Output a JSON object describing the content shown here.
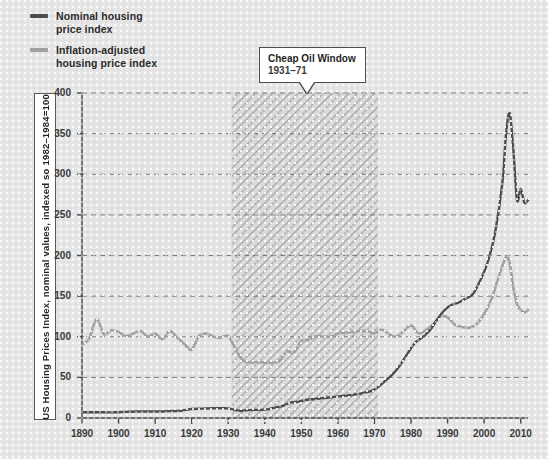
{
  "legend": {
    "items": [
      {
        "label": "Nominal housing\nprice index",
        "color": "#4d4d4d",
        "name": "nominal-housing-price-index"
      },
      {
        "label": "Inflation-adjusted\nhousing price index",
        "color": "#a0a0a0",
        "name": "inflation-adjusted-housing-price-index"
      }
    ]
  },
  "callout": {
    "title": "Cheap Oil Window",
    "subtitle": "1931–71",
    "band_start": 1931,
    "band_end": 1971
  },
  "chart_data": {
    "type": "line",
    "title": "",
    "xlabel": "",
    "ylabel": "US Housing Prices Index, nominal values, indexed so 1982–1984=100",
    "xlim": [
      1890,
      2012
    ],
    "ylim": [
      0,
      400
    ],
    "ytick_labels": [
      "0",
      "50",
      "100",
      "150",
      "200",
      "250",
      "300",
      "350",
      "400"
    ],
    "yticks": [
      0,
      50,
      100,
      150,
      200,
      250,
      300,
      350,
      400
    ],
    "xtick_labels": [
      "1890",
      "1900",
      "1910",
      "1920",
      "1930",
      "1940",
      "1950",
      "1960",
      "1970",
      "1980",
      "1990",
      "2000",
      "2010"
    ],
    "xticks": [
      1890,
      1900,
      1910,
      1920,
      1930,
      1940,
      1950,
      1960,
      1970,
      1980,
      1990,
      2000,
      2010
    ],
    "grid": true,
    "grid_style": "dashed",
    "legend_position": "top-left",
    "annotations": [
      {
        "type": "span",
        "label": "Cheap Oil Window 1931–71",
        "x_start": 1931,
        "x_end": 1971,
        "style": "hatched"
      }
    ],
    "series": [
      {
        "name": "Nominal housing price index",
        "color": "#4d4d4d",
        "x": [
          1890,
          1893,
          1896,
          1899,
          1902,
          1905,
          1908,
          1911,
          1914,
          1917,
          1920,
          1923,
          1926,
          1929,
          1931,
          1933,
          1935,
          1937,
          1939,
          1941,
          1943,
          1945,
          1947,
          1949,
          1951,
          1953,
          1955,
          1957,
          1959,
          1961,
          1963,
          1965,
          1967,
          1969,
          1971,
          1973,
          1975,
          1977,
          1979,
          1981,
          1983,
          1985,
          1987,
          1989,
          1991,
          1993,
          1995,
          1997,
          1999,
          2001,
          2003,
          2005,
          2006,
          2007,
          2008,
          2009,
          2010,
          2011,
          2012
        ],
        "y": [
          7,
          7,
          7,
          7,
          7.5,
          8,
          8,
          8,
          8.5,
          9,
          11,
          11.5,
          12,
          12,
          11,
          9,
          9.5,
          10,
          10,
          11,
          13,
          15,
          19,
          20,
          22,
          23,
          24,
          25,
          26,
          27,
          28,
          29,
          31,
          33,
          38,
          46,
          54,
          65,
          79,
          92,
          99,
          107,
          120,
          132,
          139,
          142,
          147,
          153,
          170,
          192,
          228,
          290,
          350,
          375,
          330,
          268,
          282,
          265,
          268
        ]
      },
      {
        "name": "Inflation-adjusted housing price index",
        "color": "#a0a0a0",
        "x": [
          1890,
          1892,
          1894,
          1896,
          1898,
          1900,
          1902,
          1904,
          1906,
          1908,
          1910,
          1912,
          1914,
          1916,
          1918,
          1920,
          1922,
          1924,
          1926,
          1928,
          1930,
          1932,
          1934,
          1936,
          1938,
          1940,
          1942,
          1944,
          1946,
          1948,
          1950,
          1952,
          1954,
          1956,
          1958,
          1960,
          1962,
          1964,
          1966,
          1968,
          1970,
          1972,
          1974,
          1976,
          1978,
          1980,
          1982,
          1984,
          1986,
          1988,
          1990,
          1992,
          1994,
          1996,
          1998,
          2000,
          2002,
          2004,
          2006,
          2007,
          2008,
          2009,
          2010,
          2011,
          2012
        ],
        "y": [
          90,
          98,
          122,
          103,
          108,
          106,
          101,
          104,
          107,
          100,
          104,
          97,
          107,
          99,
          91,
          84,
          101,
          104,
          100,
          99,
          101,
          85,
          71,
          68,
          69,
          68,
          68,
          70,
          82,
          81,
          95,
          96,
          101,
          100,
          100,
          104,
          105,
          106,
          107,
          107,
          104,
          109,
          103,
          100,
          107,
          114,
          104,
          108,
          115,
          125,
          124,
          115,
          112,
          111,
          116,
          128,
          146,
          174,
          198,
          190,
          160,
          140,
          133,
          130,
          133
        ]
      }
    ]
  }
}
